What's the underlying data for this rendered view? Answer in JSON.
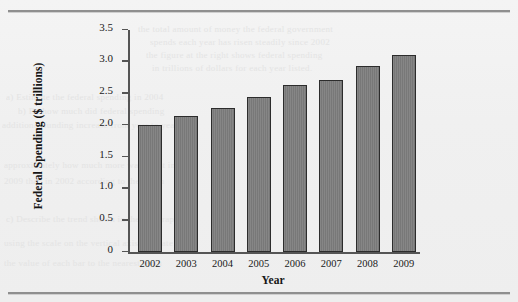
{
  "figure": {
    "background_color": "#f0f0f0",
    "rule_color": "#8f8f8f",
    "bar_fill_color": "#7d7d7d",
    "bar_border_color": "#2c2c2c",
    "axis_color": "#555555"
  },
  "ghost_text": [
    "the total amount of money the federal government",
    "spends each year has risen steadily since 2002",
    "the figure at the right shows federal spending",
    "in trillions of dollars for each year listed.",
    "a)  Estimate the federal spending in 2004",
    "b)  By how much did federal spending",
    "additional funding increase from year to year",
    "approximately how much more was spent in",
    "2009 than in 2002 according to the graph",
    "c)  Describe the trend shown in the bar graph",
    "using the scale on the vertical axis estimate",
    "the value of each bar to the nearest tenth"
  ],
  "chart_data": {
    "type": "bar",
    "title": "",
    "xlabel": "Year",
    "ylabel": "Federal Spending ($ trillions)",
    "categories": [
      "2002",
      "2003",
      "2004",
      "2005",
      "2006",
      "2007",
      "2008",
      "2009"
    ],
    "values": [
      2.0,
      2.15,
      2.27,
      2.45,
      2.63,
      2.72,
      2.93,
      3.1
    ],
    "ylim": [
      0,
      3.5
    ],
    "ytick_labels": [
      "0",
      "0.5",
      "1.0",
      "1.5",
      "2.0",
      "2.5",
      "3.0",
      "3.5"
    ],
    "ytick_values": [
      0,
      0.5,
      1.0,
      1.5,
      2.0,
      2.5,
      3.0,
      3.5
    ],
    "grid": false,
    "legend": "none"
  }
}
